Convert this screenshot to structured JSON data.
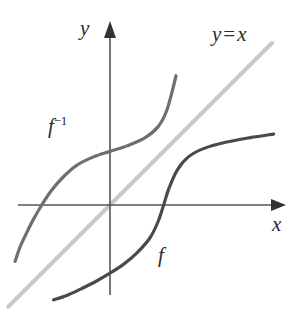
{
  "figure": {
    "background_color": "#ffffff"
  },
  "axes": {
    "x_axis_label": "x",
    "y_axis_label": "y",
    "axis_color": "#555555",
    "origin": {
      "x": 110,
      "y": 205
    },
    "x_axis": {
      "x_start": 18,
      "x_end": 285,
      "y": 205
    },
    "y_axis": {
      "x": 110,
      "y_start": 22,
      "y_end": 295
    }
  },
  "labels": {
    "f": "f",
    "f_inverse_base": "f",
    "f_inverse_exponent": "−1",
    "identity_line_y": "y",
    "identity_line_eq": "=",
    "identity_line_x": "x"
  },
  "colors": {
    "f_curve": "#4a4a4a",
    "f_inverse_curve": "#6f6f6f",
    "identity_line": "#c9c9c9",
    "axis": "#555555",
    "label_text": "#2b2b2b"
  },
  "chart_data": {
    "type": "line",
    "title": "",
    "xlabel": "x",
    "ylabel": "y",
    "grid": false,
    "legend": "inline-annotations",
    "axis_ranges": {
      "xlim": [
        -5.1,
        6.5
      ],
      "ylim": [
        -4.0,
        4.6
      ]
    },
    "annotations": [
      {
        "text": "y = x",
        "x": 4.6,
        "y": 4.1,
        "target": "identity-line"
      },
      {
        "text": "f⁻¹",
        "x": -2.6,
        "y": 2.0,
        "target": "f-inverse-curve"
      },
      {
        "text": "f",
        "x": 1.4,
        "y": -1.3,
        "target": "f-curve"
      }
    ],
    "series": [
      {
        "name": "f",
        "color": "#4a4a4a",
        "stroke_width": 3.2,
        "description": "increasing sigmoid-shaped curve crossing the x-axis near x = 1.9",
        "points": [
          {
            "x": -2.05,
            "y": -3.45
          },
          {
            "x": -1.55,
            "y": -3.28
          },
          {
            "x": -1.05,
            "y": -3.05
          },
          {
            "x": -0.55,
            "y": -2.8
          },
          {
            "x": 0.0,
            "y": -2.48
          },
          {
            "x": 0.5,
            "y": -2.15
          },
          {
            "x": 1.0,
            "y": -1.72
          },
          {
            "x": 1.45,
            "y": -1.2
          },
          {
            "x": 1.75,
            "y": -0.6
          },
          {
            "x": 1.95,
            "y": 0.0
          },
          {
            "x": 2.15,
            "y": 0.62
          },
          {
            "x": 2.45,
            "y": 1.28
          },
          {
            "x": 2.85,
            "y": 1.75
          },
          {
            "x": 3.4,
            "y": 2.05
          },
          {
            "x": 4.2,
            "y": 2.28
          },
          {
            "x": 5.1,
            "y": 2.45
          },
          {
            "x": 5.95,
            "y": 2.58
          }
        ]
      },
      {
        "name": "f-inverse",
        "color": "#6f6f6f",
        "stroke_width": 3.2,
        "description": "reflection of f about y = x; crosses the y-axis near y = 1.9 and the x-axis near x = -2.5",
        "points": [
          {
            "x": -3.45,
            "y": -2.05
          },
          {
            "x": -3.28,
            "y": -1.55
          },
          {
            "x": -3.05,
            "y": -1.05
          },
          {
            "x": -2.8,
            "y": -0.55
          },
          {
            "x": -2.48,
            "y": 0.0
          },
          {
            "x": -2.15,
            "y": 0.5
          },
          {
            "x": -1.72,
            "y": 1.0
          },
          {
            "x": -1.2,
            "y": 1.45
          },
          {
            "x": -0.6,
            "y": 1.75
          },
          {
            "x": 0.0,
            "y": 1.95
          },
          {
            "x": 0.62,
            "y": 2.15
          },
          {
            "x": 1.28,
            "y": 2.45
          },
          {
            "x": 1.75,
            "y": 2.85
          },
          {
            "x": 2.05,
            "y": 3.4
          },
          {
            "x": 2.28,
            "y": 4.2
          },
          {
            "x": 2.4,
            "y": 4.7
          }
        ]
      },
      {
        "name": "y = x",
        "color": "#c9c9c9",
        "stroke_width": 4.0,
        "description": "identity line of slope 1 through the origin",
        "points": [
          {
            "x": -3.7,
            "y": -3.7
          },
          {
            "x": 5.9,
            "y": 5.9
          }
        ]
      }
    ]
  }
}
